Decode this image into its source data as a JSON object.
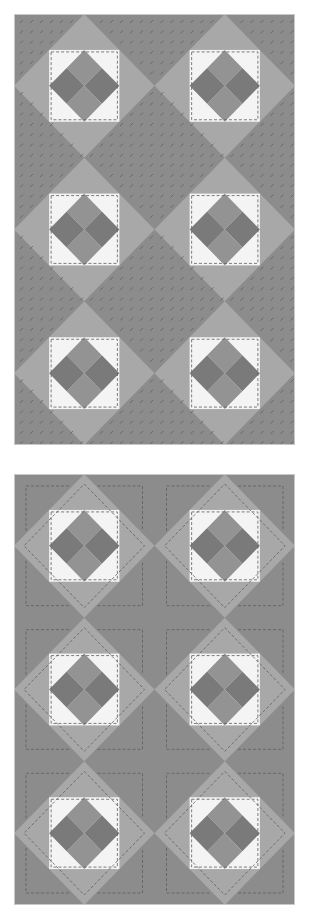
{
  "diagram": {
    "type": "quilt-layout",
    "panels": [
      {
        "id": "top",
        "label": "",
        "quilting_style": "diagonal-dashes",
        "rows": 3,
        "cols": 2
      },
      {
        "id": "bottom",
        "label": "",
        "quilting_style": "outline-echo",
        "rows": 3,
        "cols": 2
      }
    ],
    "block": {
      "layers": [
        "dark corner triangles",
        "medium diamond",
        "white square",
        "dark center diamond quartered"
      ]
    }
  },
  "colors": {
    "dark_gray": "#8c8c8c",
    "medium_gray": "#a8a8a8",
    "white": "#f4f4f4",
    "center_dark": "#7a7a7a",
    "center_mid": "#939393",
    "stitch": "#5e5e5e",
    "border": "#c8c8c8"
  }
}
